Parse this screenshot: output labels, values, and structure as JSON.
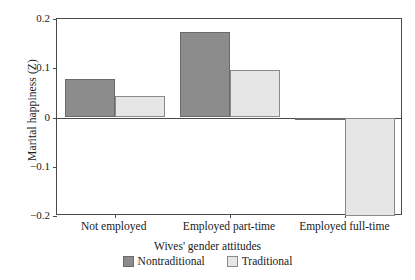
{
  "chart_data": {
    "type": "bar",
    "title": "",
    "xlabel": "Wives' gender attitudes",
    "ylabel": "Marital happiness (Z)",
    "categories": [
      "Not employed",
      "Employed part-time",
      "Employed full-time"
    ],
    "series": [
      {
        "name": "Nontraditional",
        "color": "#8c8c8c",
        "values": [
          0.078,
          0.173,
          -0.006
        ]
      },
      {
        "name": "Traditional",
        "color": "#e6e6e6",
        "values": [
          0.043,
          0.097,
          -0.2
        ]
      }
    ],
    "ylim": [
      -0.2,
      0.2
    ],
    "yticks": [
      0.2,
      0.1,
      0,
      -0.1,
      -0.2
    ],
    "ytick_labels": [
      "0.2",
      "0.1",
      "0",
      "−0.1",
      "−0.2"
    ],
    "grid": false,
    "legend_position": "bottom-center",
    "legend_title": "Wives' gender attitudes"
  }
}
